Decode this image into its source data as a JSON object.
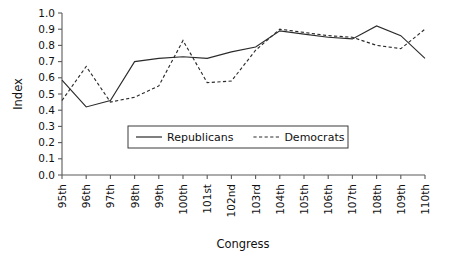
{
  "chart_data": {
    "type": "line",
    "title": "",
    "xlabel": "Congress",
    "ylabel": "Index",
    "categories": [
      "95th",
      "96th",
      "97th",
      "98th",
      "99th",
      "100th",
      "101st",
      "102nd",
      "103rd",
      "104th",
      "105th",
      "106th",
      "107th",
      "108th",
      "109th",
      "110th"
    ],
    "series": [
      {
        "name": "Republicans",
        "style": "solid",
        "values": [
          0.585,
          0.42,
          0.46,
          0.7,
          0.72,
          0.73,
          0.72,
          0.76,
          0.79,
          0.89,
          0.87,
          0.85,
          0.84,
          0.92,
          0.86,
          0.72
        ]
      },
      {
        "name": "Democrats",
        "style": "dashed",
        "values": [
          0.46,
          0.67,
          0.45,
          0.48,
          0.55,
          0.83,
          0.57,
          0.58,
          0.77,
          0.9,
          0.88,
          0.86,
          0.85,
          0.8,
          0.78,
          0.9
        ]
      }
    ],
    "ylim": [
      0.0,
      1.0
    ],
    "ytick_labels": [
      "0.0",
      "0.1",
      "0.2",
      "0.3",
      "0.4",
      "0.5",
      "0.6",
      "0.7",
      "0.8",
      "0.9",
      "1.0"
    ],
    "ytick_values": [
      0.0,
      0.1,
      0.2,
      0.3,
      0.4,
      0.5,
      0.6,
      0.7,
      0.8,
      0.9,
      1.0
    ],
    "grid": false,
    "legend_position": "lower-center-inside",
    "line_color": "#2b2b2b",
    "axis_color": "#5a5a5a"
  }
}
